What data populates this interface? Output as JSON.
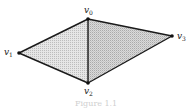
{
  "figure": {
    "caption": "Figure 1.1",
    "fill_left": "#dcdcdc",
    "fill_right": "#cfcfcf",
    "edge_color": "#1a1a1a",
    "vertices": [
      {
        "id": "v0",
        "base": "v",
        "sub": "0"
      },
      {
        "id": "v1",
        "base": "v",
        "sub": "1"
      },
      {
        "id": "v2",
        "base": "v",
        "sub": "2"
      },
      {
        "id": "v3",
        "base": "v",
        "sub": "3"
      }
    ],
    "triangles": [
      {
        "name": "triangle-v0-v1-v2",
        "vertices": [
          "v0",
          "v1",
          "v2"
        ]
      },
      {
        "name": "triangle-v0-v2-v3",
        "vertices": [
          "v0",
          "v2",
          "v3"
        ]
      }
    ],
    "edges": [
      [
        "v0",
        "v1"
      ],
      [
        "v1",
        "v2"
      ],
      [
        "v0",
        "v2"
      ],
      [
        "v0",
        "v3"
      ],
      [
        "v2",
        "v3"
      ]
    ]
  }
}
